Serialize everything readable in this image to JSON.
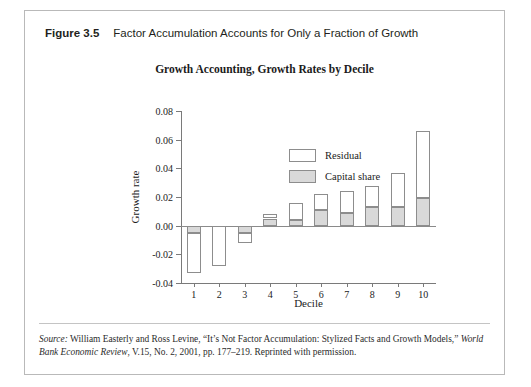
{
  "caption": {
    "figure_number": "Figure 3.5",
    "figure_title": "Factor Accumulation Accounts for Only a Fraction of Growth"
  },
  "legend": {
    "items": [
      {
        "label": "Residual",
        "color": "#ffffff"
      },
      {
        "label": "Capital share",
        "color": "#d9d9d9"
      }
    ]
  },
  "source": {
    "prefix": "Source:",
    "text_1": " William Easterly and Ross Levine, “It’s Not Factor Accumulation: Stylized Facts and Growth Models,” ",
    "italic_1": "World Bank Economic Review",
    "text_2": ", V.15, No. 2, 2001, pp. 177–219. Reprinted with permission."
  },
  "chart_data": {
    "type": "bar",
    "title": "Growth Accounting, Growth Rates by Decile",
    "xlabel": "Decile",
    "ylabel": "Growth rate",
    "categories": [
      "1",
      "2",
      "3",
      "4",
      "5",
      "6",
      "7",
      "8",
      "9",
      "10"
    ],
    "ylim": [
      -0.04,
      0.08
    ],
    "yticks": [
      0.08,
      0.06,
      0.04,
      0.02,
      0.0,
      -0.02,
      -0.04
    ],
    "ytick_labels": [
      "0.08",
      "0.06",
      "0.04",
      "0.02",
      "0.00",
      "-0.02",
      "-0.04"
    ],
    "grid": false,
    "legend_position": "upper-left-inside",
    "stacked": true,
    "series": [
      {
        "name": "Capital share",
        "color": "#d9d9d9",
        "values": [
          -0.005,
          0.0,
          -0.005,
          0.005,
          0.004,
          0.011,
          0.009,
          0.013,
          0.013,
          0.019
        ]
      },
      {
        "name": "Residual",
        "color": "#ffffff",
        "values": [
          -0.028,
          -0.028,
          -0.007,
          0.003,
          0.012,
          0.011,
          0.015,
          0.015,
          0.024,
          0.047
        ]
      }
    ],
    "totals": [
      -0.033,
      -0.028,
      -0.012,
      0.008,
      0.016,
      0.022,
      0.024,
      0.028,
      0.037,
      0.066
    ]
  }
}
